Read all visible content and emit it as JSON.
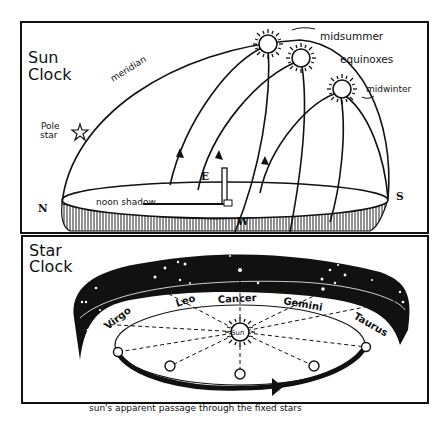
{
  "sun_clock": {
    "title_line1": "Sun",
    "title_line2": "Clock",
    "meridian_label": "meridian",
    "pole_star_line1": "Pole",
    "pole_star_line2": "star",
    "sun_labels": [
      "midsummer",
      "equinoxes",
      "midwinter"
    ],
    "compass": {
      "north": "N",
      "south": "S",
      "east": "E",
      "west": "W"
    },
    "shadow_label": "noon shadow"
  },
  "star_clock": {
    "title_line1": "Star",
    "title_line2": "Clock",
    "center_label": "Sun",
    "zodiac": [
      "Virgo",
      "Leo",
      "Cancer",
      "Gemini",
      "Taurus"
    ],
    "caption": "sun's apparent passage through the fixed stars"
  },
  "colors": {
    "ink": "#111111",
    "paper": "#ffffff"
  }
}
